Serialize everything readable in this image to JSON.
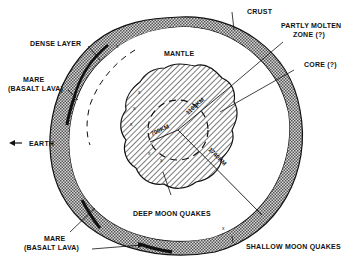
{
  "diagram": {
    "labels": {
      "crust": "CRUST",
      "partly_molten_1": "PARTLY MOLTEN",
      "partly_molten_2": "ZONE (?)",
      "core": "CORE (?)",
      "dense_layer": "DENSE LAYER",
      "mare_top_1": "MARE",
      "mare_top_2": "(BASALT LAVA)",
      "mantle": "MANTLE",
      "earth": "EARTH",
      "mare_bottom_1": "MARE",
      "mare_bottom_2": "(BASALT LAVA)",
      "deep_quakes": "DEEP MOON QUAKES",
      "shallow_quakes": "SHALLOW MOON QUAKES"
    },
    "radii": {
      "r700": "700KM",
      "r1100": "1100KM",
      "r1740": "1740KM"
    },
    "colors": {
      "ink": "#111111",
      "background": "#ffffff",
      "stipple": "#888888"
    }
  }
}
